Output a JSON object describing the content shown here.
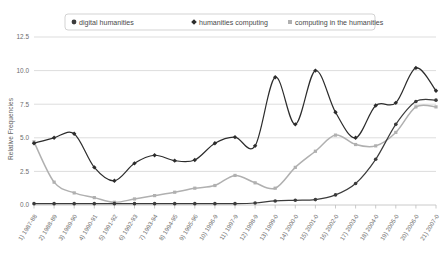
{
  "chart_data": {
    "type": "line",
    "title": "",
    "xlabel": "",
    "ylabel": "Relative Frequencies",
    "ylim": [
      0.0,
      12.5
    ],
    "yticks": [
      "0.0",
      "2.5",
      "5.0",
      "7.5",
      "10.0",
      "12.5"
    ],
    "ytick_values": [
      0.0,
      2.5,
      5.0,
      7.5,
      10.0,
      12.5
    ],
    "grid": true,
    "legend_position": "top-center",
    "categories": [
      "1) 1987-88",
      "2) 1988-89",
      "3) 1989-90",
      "4) 1990-91",
      "5) 1991-92",
      "6) 1992-93",
      "7) 1993-94",
      "8) 1994-95",
      "9) 1995-96",
      "10) 1996-9",
      "11) 1997-9",
      "12) 1998-9",
      "13) 1999-0",
      "14) 2000-0",
      "15) 2001-0",
      "16) 2002-0",
      "17) 2003-0",
      "18) 2004-0",
      "19) 2005-0",
      "20) 2006-0",
      "21) 2007-0"
    ],
    "series": [
      {
        "name": "digital humanities",
        "marker": "circle",
        "color": "#3b3b3b",
        "values": [
          0.1,
          0.1,
          0.1,
          0.1,
          0.1,
          0.1,
          0.1,
          0.1,
          0.1,
          0.1,
          0.1,
          0.15,
          0.3,
          0.35,
          0.4,
          0.75,
          1.6,
          3.4,
          6.0,
          7.7,
          7.8
        ]
      },
      {
        "name": "humanities computing",
        "marker": "diamond",
        "color": "#2c2c2c",
        "values": [
          4.6,
          5.0,
          5.3,
          2.8,
          1.8,
          3.1,
          3.7,
          3.3,
          3.35,
          4.6,
          5.05,
          4.4,
          9.5,
          6.0,
          10.0,
          6.9,
          5.0,
          7.4,
          7.6,
          10.2,
          8.5
        ]
      },
      {
        "name": "computing in the humanities",
        "marker": "square",
        "color": "#b0b0b0",
        "values": [
          4.7,
          1.7,
          0.9,
          0.55,
          0.2,
          0.45,
          0.7,
          0.95,
          1.25,
          1.45,
          2.2,
          1.65,
          1.25,
          2.8,
          4.0,
          5.2,
          4.5,
          4.4,
          5.4,
          7.3,
          7.3
        ]
      }
    ]
  },
  "legend": {
    "items": [
      {
        "label": "digital humanities",
        "marker": "circle-marker",
        "color": "#3b3b3b"
      },
      {
        "label": "humanities computing",
        "marker": "diamond-marker",
        "color": "#2c2c2c"
      },
      {
        "label": "computing in the humanities",
        "marker": "square-marker",
        "color": "#b0b0b0"
      }
    ]
  },
  "axes": {
    "y_axis_title": "Relative Frequencies"
  }
}
